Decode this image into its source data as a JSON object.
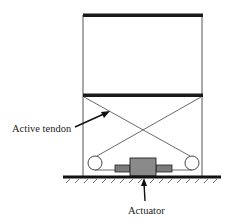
{
  "diagram": {
    "type": "structural schematic",
    "labels": {
      "tendon": "Active tendon",
      "actuator": "Actuator"
    },
    "colors": {
      "line": "#2a2a2a",
      "beam": "#1a1a1a",
      "actuator_fill": "#8a8a8a",
      "background": "#ffffff"
    },
    "elements": [
      "top-floor-beam",
      "middle-floor-beam",
      "left-column",
      "right-column",
      "crossed-tendons",
      "left-pulley",
      "right-pulley",
      "actuator-body",
      "actuator-rods",
      "ground-line-with-hatching"
    ]
  }
}
